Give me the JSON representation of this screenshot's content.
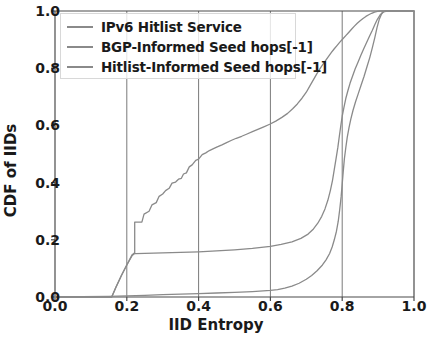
{
  "chart_data": {
    "type": "line",
    "title": "",
    "subtitle": "",
    "xlabel": "IID Entropy",
    "ylabel": "CDF of IIDs",
    "xlim": [
      0.0,
      1.0
    ],
    "ylim": [
      0.0,
      1.0
    ],
    "xticks": [
      "0.0",
      "0.2",
      "0.4",
      "0.6",
      "0.8",
      "1.0"
    ],
    "xtick_values": [
      0.0,
      0.2,
      0.4,
      0.6,
      0.8,
      1.0
    ],
    "yticks": [
      "0.0",
      "0.2",
      "0.4",
      "0.6",
      "0.8",
      "1.0"
    ],
    "ytick_values": [
      0.0,
      0.2,
      0.4,
      0.6,
      0.8,
      1.0
    ],
    "grid": "vertical-only",
    "gridlines_x": [
      0.2,
      0.4,
      0.6,
      0.8
    ],
    "legend_position": "upper left",
    "legend_entries": [
      "IPv6 Hitlist Service",
      "BGP-Informed Seed hops[-1]",
      "Hitlist-Informed Seed hops[-1]"
    ],
    "colors": {
      "ipv6_hitlist_service": "#8a8a8a",
      "bgp_informed_seed": "#8a8a8a",
      "hitlist_informed_seed": "#8a8a8a",
      "axis": "#4a4a4a",
      "grid": "#7a7a7a",
      "text": "#1a1a1a"
    },
    "series": [
      {
        "name": "IPv6 Hitlist Service",
        "points": [
          [
            0.0,
            0.0
          ],
          [
            0.15,
            0.002
          ],
          [
            0.2,
            0.004
          ],
          [
            0.25,
            0.006
          ],
          [
            0.3,
            0.008
          ],
          [
            0.35,
            0.01
          ],
          [
            0.4,
            0.012
          ],
          [
            0.45,
            0.014
          ],
          [
            0.5,
            0.016
          ],
          [
            0.55,
            0.019
          ],
          [
            0.6,
            0.023
          ],
          [
            0.62,
            0.026
          ],
          [
            0.64,
            0.031
          ],
          [
            0.66,
            0.038
          ],
          [
            0.68,
            0.048
          ],
          [
            0.7,
            0.062
          ],
          [
            0.715,
            0.075
          ],
          [
            0.73,
            0.092
          ],
          [
            0.745,
            0.112
          ],
          [
            0.755,
            0.13
          ],
          [
            0.765,
            0.152
          ],
          [
            0.772,
            0.175
          ],
          [
            0.778,
            0.2
          ],
          [
            0.784,
            0.23
          ],
          [
            0.789,
            0.265
          ],
          [
            0.793,
            0.305
          ],
          [
            0.797,
            0.35
          ],
          [
            0.8,
            0.395
          ],
          [
            0.803,
            0.44
          ],
          [
            0.806,
            0.482
          ],
          [
            0.81,
            0.522
          ],
          [
            0.814,
            0.558
          ],
          [
            0.819,
            0.592
          ],
          [
            0.824,
            0.622
          ],
          [
            0.83,
            0.652
          ],
          [
            0.837,
            0.682
          ],
          [
            0.845,
            0.712
          ],
          [
            0.853,
            0.742
          ],
          [
            0.861,
            0.772
          ],
          [
            0.869,
            0.805
          ],
          [
            0.877,
            0.838
          ],
          [
            0.884,
            0.872
          ],
          [
            0.891,
            0.908
          ],
          [
            0.897,
            0.942
          ],
          [
            0.903,
            0.97
          ],
          [
            0.909,
            0.988
          ],
          [
            0.915,
            0.997
          ],
          [
            0.925,
            1.0
          ],
          [
            1.0,
            1.0
          ]
        ]
      },
      {
        "name": "BGP-Informed Seed hops[-1]",
        "points": [
          [
            0.0,
            0.0
          ],
          [
            0.158,
            0.0
          ],
          [
            0.17,
            0.035
          ],
          [
            0.185,
            0.075
          ],
          [
            0.2,
            0.112
          ],
          [
            0.215,
            0.145
          ],
          [
            0.222,
            0.152
          ],
          [
            0.225,
            0.152
          ],
          [
            0.3,
            0.154
          ],
          [
            0.4,
            0.158
          ],
          [
            0.45,
            0.161
          ],
          [
            0.5,
            0.165
          ],
          [
            0.55,
            0.17
          ],
          [
            0.6,
            0.177
          ],
          [
            0.63,
            0.184
          ],
          [
            0.66,
            0.193
          ],
          [
            0.685,
            0.205
          ],
          [
            0.705,
            0.22
          ],
          [
            0.72,
            0.238
          ],
          [
            0.732,
            0.258
          ],
          [
            0.743,
            0.282
          ],
          [
            0.752,
            0.308
          ],
          [
            0.76,
            0.338
          ],
          [
            0.767,
            0.372
          ],
          [
            0.773,
            0.408
          ],
          [
            0.778,
            0.446
          ],
          [
            0.783,
            0.485
          ],
          [
            0.788,
            0.524
          ],
          [
            0.792,
            0.562
          ],
          [
            0.796,
            0.598
          ],
          [
            0.8,
            0.632
          ],
          [
            0.805,
            0.664
          ],
          [
            0.81,
            0.694
          ],
          [
            0.816,
            0.722
          ],
          [
            0.822,
            0.748
          ],
          [
            0.829,
            0.773
          ],
          [
            0.836,
            0.797
          ],
          [
            0.844,
            0.821
          ],
          [
            0.852,
            0.845
          ],
          [
            0.86,
            0.868
          ],
          [
            0.868,
            0.89
          ],
          [
            0.876,
            0.912
          ],
          [
            0.884,
            0.933
          ],
          [
            0.891,
            0.953
          ],
          [
            0.898,
            0.971
          ],
          [
            0.905,
            0.985
          ],
          [
            0.912,
            0.995
          ],
          [
            0.92,
            1.0
          ],
          [
            1.0,
            1.0
          ]
        ]
      },
      {
        "name": "Hitlist-Informed Seed hops[-1]",
        "points": [
          [
            0.0,
            0.0
          ],
          [
            0.158,
            0.0
          ],
          [
            0.17,
            0.035
          ],
          [
            0.185,
            0.075
          ],
          [
            0.2,
            0.112
          ],
          [
            0.215,
            0.148
          ],
          [
            0.222,
            0.155
          ],
          [
            0.222,
            0.262
          ],
          [
            0.242,
            0.262
          ],
          [
            0.248,
            0.29
          ],
          [
            0.262,
            0.3
          ],
          [
            0.27,
            0.322
          ],
          [
            0.282,
            0.33
          ],
          [
            0.29,
            0.352
          ],
          [
            0.3,
            0.36
          ],
          [
            0.308,
            0.372
          ],
          [
            0.318,
            0.38
          ],
          [
            0.326,
            0.398
          ],
          [
            0.336,
            0.402
          ],
          [
            0.344,
            0.412
          ],
          [
            0.352,
            0.415
          ],
          [
            0.358,
            0.43
          ],
          [
            0.366,
            0.434
          ],
          [
            0.374,
            0.455
          ],
          [
            0.382,
            0.462
          ],
          [
            0.392,
            0.478
          ],
          [
            0.4,
            0.482
          ],
          [
            0.41,
            0.498
          ],
          [
            0.42,
            0.504
          ],
          [
            0.43,
            0.512
          ],
          [
            0.44,
            0.518
          ],
          [
            0.452,
            0.525
          ],
          [
            0.465,
            0.532
          ],
          [
            0.478,
            0.54
          ],
          [
            0.492,
            0.548
          ],
          [
            0.505,
            0.555
          ],
          [
            0.52,
            0.562
          ],
          [
            0.535,
            0.57
          ],
          [
            0.55,
            0.578
          ],
          [
            0.565,
            0.586
          ],
          [
            0.58,
            0.594
          ],
          [
            0.598,
            0.604
          ],
          [
            0.615,
            0.615
          ],
          [
            0.632,
            0.628
          ],
          [
            0.648,
            0.642
          ],
          [
            0.662,
            0.658
          ],
          [
            0.675,
            0.675
          ],
          [
            0.688,
            0.695
          ],
          [
            0.7,
            0.716
          ],
          [
            0.71,
            0.738
          ],
          [
            0.72,
            0.76
          ],
          [
            0.73,
            0.782
          ],
          [
            0.74,
            0.802
          ],
          [
            0.75,
            0.82
          ],
          [
            0.76,
            0.838
          ],
          [
            0.77,
            0.855
          ],
          [
            0.778,
            0.868
          ],
          [
            0.786,
            0.88
          ],
          [
            0.794,
            0.892
          ],
          [
            0.802,
            0.903
          ],
          [
            0.81,
            0.914
          ],
          [
            0.818,
            0.925
          ],
          [
            0.826,
            0.936
          ],
          [
            0.834,
            0.947
          ],
          [
            0.842,
            0.957
          ],
          [
            0.85,
            0.966
          ],
          [
            0.858,
            0.974
          ],
          [
            0.866,
            0.981
          ],
          [
            0.874,
            0.987
          ],
          [
            0.882,
            0.992
          ],
          [
            0.89,
            0.996
          ],
          [
            0.898,
            0.999
          ],
          [
            0.906,
            1.0
          ],
          [
            1.0,
            1.0
          ]
        ]
      }
    ],
    "plot_area_px": {
      "left": 55,
      "top": 11,
      "right": 414,
      "bottom": 297
    }
  }
}
